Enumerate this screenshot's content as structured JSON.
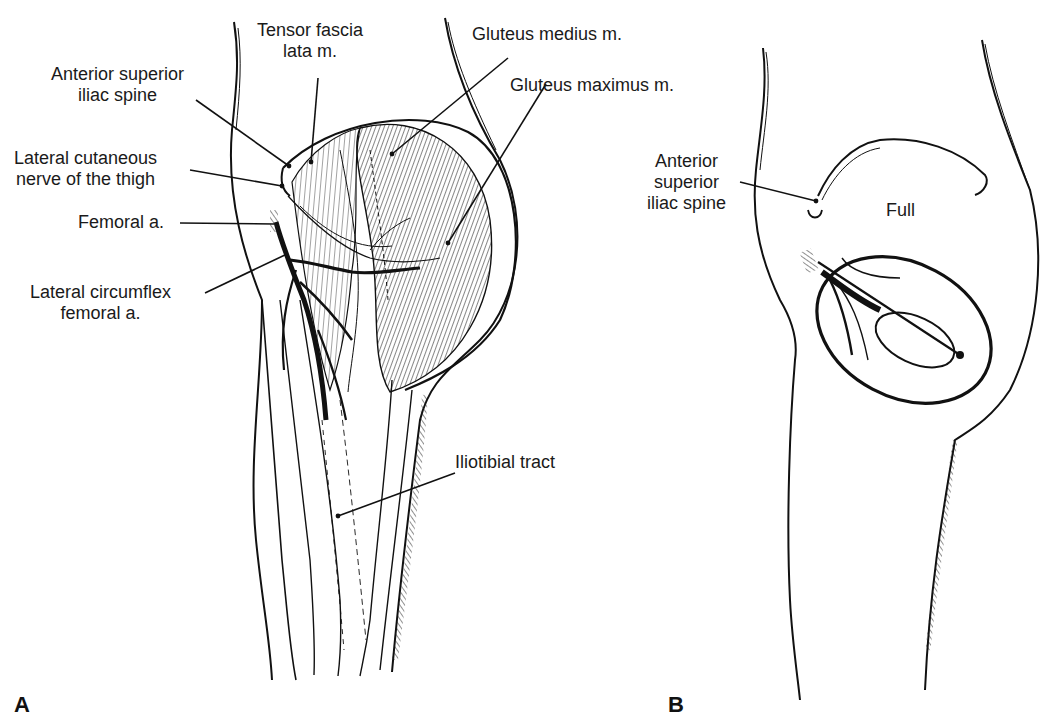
{
  "figure": {
    "panel_a": {
      "letter": "A",
      "labels": {
        "tensor_fascia": [
          "Tensor fascia",
          "lata m."
        ],
        "asis": [
          "Anterior superior",
          "iliac spine"
        ],
        "lat_cut_nerve": [
          "Lateral cutaneous",
          "nerve of the thigh"
        ],
        "femoral_a": [
          "Femoral a."
        ],
        "lat_circ": [
          "Lateral circumflex",
          "femoral a."
        ],
        "glut_med": [
          "Gluteus medius m."
        ],
        "glut_max": [
          "Gluteus maximus m."
        ],
        "itt": [
          "Iliotibial tract"
        ]
      }
    },
    "panel_b": {
      "letter": "B",
      "labels": {
        "asis": [
          "Anterior",
          "superior",
          "iliac spine"
        ],
        "full": [
          "Full"
        ]
      }
    },
    "colors": {
      "ink": "#111111",
      "background": "#ffffff"
    }
  }
}
